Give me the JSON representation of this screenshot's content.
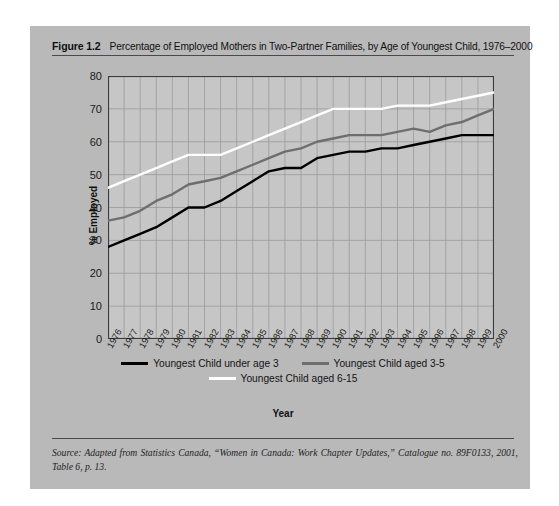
{
  "figure": {
    "label": "Figure 1.2",
    "title": "Percentage of Employed Mothers in Two-Partner Families, by Age of Youngest Child, 1976–2000",
    "source": "Source: Adapted from Statistics Canada, “Women in Canada: Work Chapter Updates,” Catalogue no. 89F0133, 2001, Table 6, p. 13."
  },
  "colors": {
    "figure_background": "#b9b9b9",
    "plot_background": "#c6c6c6",
    "gridline": "#9a9a9a",
    "axis": "#3c3c3c",
    "series_under3": "#000000",
    "series_3to5": "#6e6e6e",
    "series_6to15": "#ffffff",
    "text": "#111111"
  },
  "chart_data": {
    "type": "line",
    "title": "Percentage of Employed Mothers in Two-Partner Families, by Age of Youngest Child, 1976–2000",
    "xlabel": "Year",
    "ylabel": "% Employed",
    "ylim": [
      0,
      80
    ],
    "ytick_step": 10,
    "yticks": [
      0,
      10,
      20,
      30,
      40,
      50,
      60,
      70,
      80
    ],
    "grid": true,
    "legend_position": "bottom",
    "categories": [
      "1976",
      "1977",
      "1978",
      "1979",
      "1980",
      "1981",
      "1982",
      "1983",
      "1984",
      "1985",
      "1986",
      "1987",
      "1988",
      "1989",
      "1990",
      "1991",
      "1992",
      "1993",
      "1994",
      "1995",
      "1996",
      "1997",
      "1998",
      "1999",
      "2000"
    ],
    "series": [
      {
        "name": "Youngest Child under age 3",
        "color": "#000000",
        "values": [
          28,
          30,
          32,
          34,
          37,
          40,
          40,
          42,
          45,
          48,
          51,
          52,
          52,
          55,
          56,
          57,
          57,
          58,
          58,
          59,
          60,
          61,
          62,
          62,
          62
        ]
      },
      {
        "name": "Youngest Child aged 3-5",
        "color": "#6e6e6e",
        "values": [
          36,
          37,
          39,
          42,
          44,
          47,
          48,
          49,
          51,
          53,
          55,
          57,
          58,
          60,
          61,
          62,
          62,
          62,
          63,
          64,
          63,
          65,
          66,
          68,
          70
        ]
      },
      {
        "name": "Youngest Child aged 6-15",
        "color": "#ffffff",
        "values": [
          46,
          48,
          50,
          52,
          54,
          56,
          56,
          56,
          58,
          60,
          62,
          64,
          66,
          68,
          70,
          70,
          70,
          70,
          71,
          71,
          71,
          72,
          73,
          74,
          75
        ]
      }
    ]
  },
  "legend": [
    {
      "label": "Youngest Child under age 3",
      "color": "#000000"
    },
    {
      "label": "Youngest Child aged 3-5",
      "color": "#6e6e6e"
    },
    {
      "label": "Youngest Child aged 6-15",
      "color": "#ffffff"
    }
  ]
}
